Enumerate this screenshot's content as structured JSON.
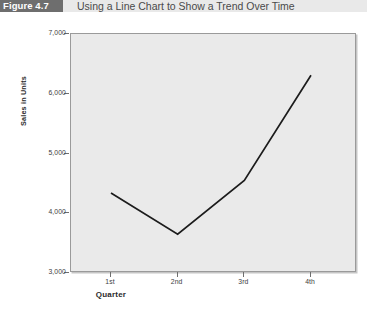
{
  "figure": {
    "badge_label": "Figure 4.7",
    "title": "Using a Line Chart to Show a Trend Over Time"
  },
  "colors": {
    "badge_background": "#6e6e6e",
    "header_background": "#e9e9e9",
    "plot_background": "#eaeaea",
    "plot_border": "#9a9a9a",
    "line_color": "#1c1c1c",
    "tick_color": "#6e6e6e",
    "text_color": "#3c3c3c"
  },
  "chart_data": {
    "type": "line",
    "title": "Using a Line Chart to Show a Trend Over Time",
    "xlabel": "Quarter",
    "ylabel": "Sales in Units",
    "categories": [
      "1st",
      "2nd",
      "3rd",
      "4th"
    ],
    "values": [
      4340,
      3650,
      4550,
      6310
    ],
    "ylim": [
      3000,
      7000
    ],
    "yticks": [
      3000,
      4000,
      5000,
      6000,
      7000
    ],
    "ytick_labels": [
      "3,000",
      "4,000",
      "5,000",
      "6,000",
      "7,000"
    ],
    "grid": false,
    "legend": false,
    "markers": false,
    "series": [
      {
        "name": "Sales in Units",
        "values": [
          4340,
          3650,
          4550,
          6310
        ]
      }
    ]
  }
}
